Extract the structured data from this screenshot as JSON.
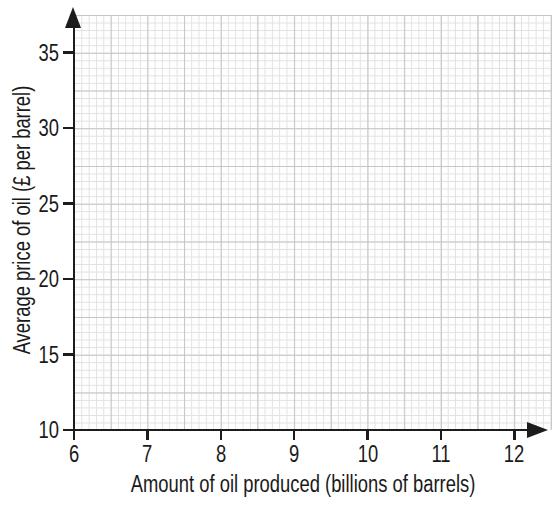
{
  "figure": {
    "background": "#ffffff",
    "axis_color": "#1c1c1c",
    "text_color": "#1a1a1a",
    "grid_minor_color": "#e1e1e1",
    "grid_major_color": "#c6c6c6"
  },
  "chart_data": {
    "type": "scatter",
    "title": "",
    "xlabel": "Amount of oil produced (billions of barrels)",
    "ylabel": "Average price of oil (£ per barrel)",
    "xlim": [
      6,
      12.45
    ],
    "ylim": [
      10,
      37.6
    ],
    "x_ticks": [
      6,
      7,
      8,
      9,
      10,
      11,
      12
    ],
    "y_ticks": [
      10,
      15,
      20,
      25,
      30,
      35
    ],
    "grid": "on",
    "legend": "none",
    "series": []
  }
}
